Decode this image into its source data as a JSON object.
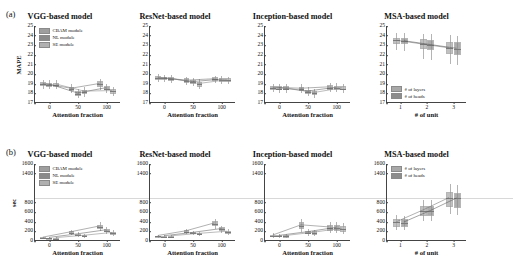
{
  "figure": {
    "panel_a_tag": "(a)",
    "panel_b_tag": "(b)"
  },
  "legends": {
    "module": [
      {
        "label": "CBAM module",
        "color": "#9e9e9e"
      },
      {
        "label": "NL module",
        "color": "#8a8a8a"
      },
      {
        "label": "SE module",
        "color": "#b0b0b0"
      }
    ],
    "msa": [
      {
        "label": "# of layers",
        "color": "#a8a8a8"
      },
      {
        "label": "# of heads",
        "color": "#8d8d8d"
      }
    ]
  },
  "chart_data": [
    {
      "id": "a-vgg",
      "type": "bar",
      "title": "VGG-based model",
      "xlabel": "Attention fraction",
      "ylabel": "MAPE",
      "categories": [
        "0",
        "50",
        "100"
      ],
      "ylim": [
        17,
        25
      ],
      "yticks": [
        17,
        18,
        19,
        20,
        21,
        22,
        23,
        24,
        25
      ],
      "grid": false,
      "legend_position": "top-left",
      "series": [
        {
          "name": "CBAM module",
          "values": [
            18.95,
            18.45,
            18.95
          ],
          "q1": [
            18.75,
            18.25,
            18.7
          ],
          "q3": [
            19.15,
            18.7,
            19.25
          ],
          "lo": [
            18.5,
            18.0,
            18.4
          ],
          "hi": [
            19.4,
            18.95,
            19.5
          ]
        },
        {
          "name": "NL module",
          "values": [
            18.9,
            17.95,
            18.5
          ],
          "q1": [
            18.7,
            17.75,
            18.3
          ],
          "q3": [
            19.1,
            18.25,
            18.75
          ],
          "lo": [
            18.45,
            17.5,
            18.05
          ],
          "hi": [
            19.35,
            18.5,
            19.0
          ]
        },
        {
          "name": "SE module",
          "values": [
            18.9,
            18.15,
            18.2
          ],
          "q1": [
            18.7,
            17.9,
            17.95
          ],
          "q3": [
            19.1,
            18.4,
            18.45
          ],
          "lo": [
            18.45,
            17.65,
            17.7
          ],
          "hi": [
            19.35,
            18.65,
            18.7
          ]
        }
      ]
    },
    {
      "id": "a-resnet",
      "type": "bar",
      "title": "ResNet-based model",
      "xlabel": "Attention fraction",
      "ylabel": "",
      "categories": [
        "0",
        "50",
        "100"
      ],
      "ylim": [
        17,
        25
      ],
      "yticks": [
        17,
        18,
        19,
        20,
        21,
        22,
        23,
        24,
        25
      ],
      "grid": false,
      "legend_position": "none",
      "series": [
        {
          "name": "CBAM module",
          "values": [
            19.6,
            19.3,
            19.45
          ],
          "q1": [
            19.4,
            19.1,
            19.25
          ],
          "q3": [
            19.8,
            19.55,
            19.65
          ],
          "lo": [
            19.2,
            18.9,
            19.05
          ],
          "hi": [
            20.0,
            19.75,
            19.85
          ]
        },
        {
          "name": "NL module",
          "values": [
            19.55,
            19.15,
            19.4
          ],
          "q1": [
            19.35,
            18.95,
            19.2
          ],
          "q3": [
            19.75,
            19.4,
            19.6
          ],
          "lo": [
            19.15,
            18.75,
            19.0
          ],
          "hi": [
            19.95,
            19.6,
            19.8
          ]
        },
        {
          "name": "SE module",
          "values": [
            19.5,
            18.95,
            19.35
          ],
          "q1": [
            19.3,
            18.7,
            19.15
          ],
          "q3": [
            19.7,
            19.2,
            19.55
          ],
          "lo": [
            19.1,
            18.5,
            18.95
          ],
          "hi": [
            19.9,
            19.45,
            19.75
          ]
        }
      ]
    },
    {
      "id": "a-inception",
      "type": "bar",
      "title": "Inception-based model",
      "xlabel": "Attention fraction",
      "ylabel": "",
      "categories": [
        "0",
        "50",
        "100"
      ],
      "ylim": [
        17,
        25
      ],
      "yticks": [
        17,
        18,
        19,
        20,
        21,
        22,
        23,
        24,
        25
      ],
      "grid": false,
      "legend_position": "none",
      "series": [
        {
          "name": "CBAM module",
          "values": [
            18.55,
            18.45,
            18.6
          ],
          "q1": [
            18.35,
            18.25,
            18.4
          ],
          "q3": [
            18.8,
            18.7,
            18.85
          ],
          "lo": [
            18.1,
            18.0,
            18.15
          ],
          "hi": [
            19.0,
            18.95,
            19.1
          ]
        },
        {
          "name": "NL module",
          "values": [
            18.5,
            18.15,
            18.55
          ],
          "q1": [
            18.3,
            17.95,
            18.35
          ],
          "q3": [
            18.75,
            18.4,
            18.8
          ],
          "lo": [
            18.05,
            17.7,
            18.1
          ],
          "hi": [
            18.95,
            18.65,
            19.05
          ]
        },
        {
          "name": "SE module",
          "values": [
            18.5,
            18.0,
            18.5
          ],
          "q1": [
            18.3,
            17.8,
            18.3
          ],
          "q3": [
            18.75,
            18.25,
            18.75
          ],
          "lo": [
            18.05,
            17.55,
            18.05
          ],
          "hi": [
            18.95,
            18.5,
            19.0
          ]
        }
      ]
    },
    {
      "id": "a-msa",
      "type": "bar",
      "title": "MSA-based model",
      "xlabel": "# of unit",
      "ylabel": "",
      "categories": [
        "1",
        "2",
        "3"
      ],
      "ylim": [
        17,
        25
      ],
      "yticks": [
        17,
        18,
        19,
        20,
        21,
        22,
        23,
        24,
        25
      ],
      "grid": false,
      "legend_position": "bottom-left",
      "series": [
        {
          "name": "# of layers",
          "values": [
            23.5,
            23.1,
            22.7
          ],
          "q1": [
            23.15,
            22.6,
            22.05
          ],
          "q3": [
            23.8,
            23.6,
            23.35
          ],
          "lo": [
            22.5,
            21.6,
            21.0
          ],
          "hi": [
            24.3,
            24.2,
            24.1
          ]
        },
        {
          "name": "# of heads",
          "values": [
            23.45,
            23.05,
            22.65
          ],
          "q1": [
            23.1,
            22.5,
            21.95
          ],
          "q3": [
            23.75,
            23.55,
            23.3
          ],
          "lo": [
            22.45,
            21.5,
            20.9
          ],
          "hi": [
            24.25,
            24.15,
            24.0
          ]
        }
      ]
    },
    {
      "id": "b-vgg",
      "type": "bar",
      "title": "VGG-based model",
      "xlabel": "Attention fraction",
      "ylabel": "sec",
      "categories": [
        "0",
        "50",
        "100"
      ],
      "ylim": [
        0,
        1600
      ],
      "yticks": [
        0,
        200,
        400,
        600,
        800,
        1000,
        1200,
        1400,
        1600
      ],
      "visible_yticks": [
        0,
        200,
        400,
        600,
        800,
        1400,
        1600
      ],
      "grid": false,
      "legend_position": "top-left",
      "series": [
        {
          "name": "CBAM module",
          "values": [
            60,
            175,
            295
          ],
          "q1": [
            45,
            150,
            245
          ],
          "q3": [
            75,
            205,
            340
          ],
          "lo": [
            35,
            125,
            205
          ],
          "hi": [
            90,
            235,
            385
          ]
        },
        {
          "name": "NL module",
          "values": [
            55,
            130,
            215
          ],
          "q1": [
            42,
            110,
            180
          ],
          "q3": [
            70,
            155,
            250
          ],
          "lo": [
            32,
            92,
            150
          ],
          "hi": [
            85,
            178,
            288
          ]
        },
        {
          "name": "SE module",
          "values": [
            50,
            100,
            160
          ],
          "q1": [
            38,
            82,
            130
          ],
          "q3": [
            64,
            122,
            195
          ],
          "lo": [
            30,
            68,
            108
          ],
          "hi": [
            78,
            140,
            228
          ]
        }
      ]
    },
    {
      "id": "b-resnet",
      "type": "bar",
      "title": "ResNet-based model",
      "xlabel": "Attention fraction",
      "ylabel": "",
      "categories": [
        "0",
        "50",
        "100"
      ],
      "ylim": [
        0,
        1600
      ],
      "yticks": [
        0,
        200,
        400,
        600,
        800,
        1000,
        1200,
        1400,
        1600
      ],
      "visible_yticks": [
        0,
        200,
        400,
        600,
        800,
        1400,
        1600
      ],
      "grid": false,
      "legend_position": "none",
      "series": [
        {
          "name": "CBAM module",
          "values": [
            95,
            195,
            360
          ],
          "q1": [
            80,
            165,
            305
          ],
          "q3": [
            112,
            228,
            415
          ],
          "lo": [
            68,
            140,
            258
          ],
          "hi": [
            128,
            258,
            465
          ]
        },
        {
          "name": "NL module",
          "values": [
            90,
            160,
            240
          ],
          "q1": [
            76,
            136,
            200
          ],
          "q3": [
            106,
            188,
            282
          ],
          "lo": [
            64,
            115,
            168
          ],
          "hi": [
            120,
            212,
            320
          ]
        },
        {
          "name": "SE module",
          "values": [
            88,
            140,
            185
          ],
          "q1": [
            74,
            118,
            152
          ],
          "q3": [
            104,
            164,
            218
          ],
          "lo": [
            62,
            100,
            128
          ],
          "hi": [
            118,
            186,
            248
          ]
        }
      ]
    },
    {
      "id": "b-inception",
      "type": "bar",
      "title": "Inception-based model",
      "xlabel": "Attention fraction",
      "ylabel": "",
      "categories": [
        "0",
        "50",
        "100"
      ],
      "ylim": [
        0,
        1600
      ],
      "yticks": [
        0,
        200,
        400,
        600,
        800,
        1000,
        1200,
        1400,
        1600
      ],
      "visible_yticks": [
        0,
        200,
        400,
        600,
        800,
        1400,
        1600
      ],
      "grid": false,
      "legend_position": "none",
      "series": [
        {
          "name": "CBAM module",
          "values": [
            105,
            320,
            275
          ],
          "q1": [
            78,
            250,
            215
          ],
          "q3": [
            135,
            390,
            340
          ],
          "lo": [
            58,
            190,
            165
          ],
          "hi": [
            158,
            452,
            398
          ]
        },
        {
          "name": "NL module",
          "values": [
            98,
            175,
            265
          ],
          "q1": [
            74,
            140,
            205
          ],
          "q3": [
            126,
            215,
            328
          ],
          "lo": [
            55,
            108,
            158
          ],
          "hi": [
            148,
            252,
            385
          ]
        },
        {
          "name": "SE module",
          "values": [
            95,
            165,
            250
          ],
          "q1": [
            72,
            132,
            195
          ],
          "q3": [
            122,
            202,
            310
          ],
          "lo": [
            54,
            102,
            150
          ],
          "hi": [
            144,
            238,
            365
          ]
        }
      ]
    },
    {
      "id": "b-msa",
      "type": "bar",
      "title": "MSA-based model",
      "xlabel": "# of unit",
      "ylabel": "",
      "categories": [
        "1",
        "2",
        "3"
      ],
      "ylim": [
        0,
        1600
      ],
      "yticks": [
        0,
        200,
        400,
        600,
        800,
        1000,
        1200,
        1400,
        1600
      ],
      "visible_yticks": [
        0,
        200,
        400,
        600,
        800,
        1400,
        1600
      ],
      "grid": false,
      "legend_position": "top-left",
      "series": [
        {
          "name": "# of layers",
          "values": [
            385,
            630,
            895
          ],
          "q1": [
            300,
            520,
            700
          ],
          "q3": [
            455,
            735,
            1010
          ],
          "lo": [
            235,
            420,
            560
          ],
          "hi": [
            530,
            855,
            1180
          ]
        },
        {
          "name": "# of heads",
          "values": [
            380,
            620,
            885
          ],
          "q1": [
            295,
            510,
            690
          ],
          "q3": [
            450,
            725,
            1000
          ],
          "lo": [
            230,
            410,
            550
          ],
          "hi": [
            525,
            845,
            1170
          ]
        }
      ]
    }
  ]
}
